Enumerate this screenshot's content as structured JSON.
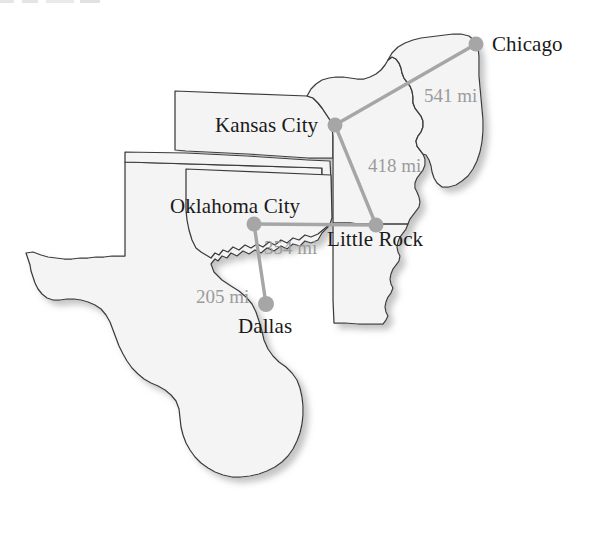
{
  "map": {
    "title": "Route distance map of the south-central United States",
    "colors": {
      "state_fill": "#f4f4f4",
      "state_outline": "#3a3a3a",
      "shadow": "#c9c9c9",
      "marker": "#a6a6a6",
      "route_line": "#a6a6a6",
      "city_text": "#1a1a1a",
      "distance_text": "#9b9b9b",
      "background": "#ffffff"
    },
    "cities": [
      {
        "id": "chicago",
        "name": "Chicago",
        "dot_x": 476,
        "dot_y": 44,
        "label_x": 492,
        "label_y": 34
      },
      {
        "id": "kansas-city",
        "name": "Kansas City",
        "dot_x": 335,
        "dot_y": 125,
        "label_x": 215,
        "label_y": 115
      },
      {
        "id": "little-rock",
        "name": "Little Rock",
        "dot_x": 376,
        "dot_y": 225,
        "label_x": 327,
        "label_y": 229
      },
      {
        "id": "oklahoma-city",
        "name": "Oklahoma City",
        "dot_x": 254,
        "dot_y": 224,
        "label_x": 170,
        "label_y": 196
      },
      {
        "id": "dallas",
        "name": "Dallas",
        "dot_x": 266,
        "dot_y": 304,
        "label_x": 238,
        "label_y": 316
      }
    ],
    "routes": [
      {
        "id": "chicago-kansas-city",
        "from": "chicago",
        "to": "kansas-city",
        "distance": "541 mi",
        "label_x": 424,
        "label_y": 86
      },
      {
        "id": "kansas-city-little-rock",
        "from": "kansas-city",
        "to": "little-rock",
        "distance": "418 mi",
        "label_x": 368,
        "label_y": 156
      },
      {
        "id": "oklahoma-city-little-rock",
        "from": "oklahoma-city",
        "to": "little-rock",
        "distance": "354 mi",
        "label_x": 264,
        "label_y": 238
      },
      {
        "id": "oklahoma-city-dallas",
        "from": "oklahoma-city",
        "to": "dallas",
        "distance": "205 mi",
        "label_x": 196,
        "label_y": 287
      }
    ],
    "states": [
      {
        "id": "texas",
        "name": "Texas"
      },
      {
        "id": "oklahoma",
        "name": "Oklahoma"
      },
      {
        "id": "kansas",
        "name": "Kansas"
      },
      {
        "id": "missouri",
        "name": "Missouri"
      },
      {
        "id": "arkansas",
        "name": "Arkansas"
      },
      {
        "id": "illinois",
        "name": "Illinois"
      }
    ]
  }
}
